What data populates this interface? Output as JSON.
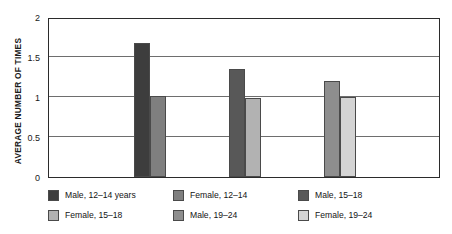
{
  "chart_data": {
    "type": "bar",
    "title": "",
    "xlabel": "",
    "ylabel": "AVERAGE NUMBER OF TIMES",
    "ylim": [
      0,
      2
    ],
    "yticks": [
      0,
      0.5,
      1,
      1.5,
      2
    ],
    "ytick_labels": [
      "0",
      "0.5",
      "1",
      "1.5",
      "2"
    ],
    "grid": true,
    "legend_position": "bottom",
    "categories": [
      "12–14 years",
      "15–18",
      "19–24"
    ],
    "series": [
      {
        "name": "Male",
        "values": [
          1.68,
          1.35,
          1.2
        ]
      },
      {
        "name": "Female",
        "values": [
          1.01,
          0.99,
          1.0
        ]
      }
    ],
    "bars": [
      {
        "label": "Male, 12–14 years",
        "value": 1.68,
        "color": "#3d3d3d"
      },
      {
        "label": "Female, 12–14",
        "value": 1.01,
        "color": "#7f7f7f"
      },
      {
        "label": "Male, 15–18",
        "value": 1.35,
        "color": "#585858"
      },
      {
        "label": "Female, 15–18",
        "value": 0.99,
        "color": "#b2b2b2"
      },
      {
        "label": "Male, 19–24",
        "value": 1.2,
        "color": "#8e8e8e"
      },
      {
        "label": "Female, 19–24",
        "value": 1.0,
        "color": "#d4d4d4"
      }
    ]
  },
  "axis": {
    "y_title": "AVERAGE NUMBER OF TIMES",
    "ticks": [
      {
        "label": "2",
        "value": 2
      },
      {
        "label": "1.5",
        "value": 1.5
      },
      {
        "label": "1",
        "value": 1
      },
      {
        "label": "0.5",
        "value": 0.5
      },
      {
        "label": "0",
        "value": 0
      }
    ]
  },
  "legend": {
    "rows": [
      [
        {
          "label": "Male, 12–14 years",
          "color": "#3d3d3d"
        },
        {
          "label": "Female, 12–14",
          "color": "#7f7f7f"
        },
        {
          "label": "Male, 15–18",
          "color": "#585858"
        }
      ],
      [
        {
          "label": "Female, 15–18",
          "color": "#b2b2b2"
        },
        {
          "label": "Male, 19–24",
          "color": "#8e8e8e"
        },
        {
          "label": "Female, 19–24",
          "color": "#d4d4d4"
        }
      ]
    ]
  },
  "colors": {
    "frame": "#2b2b2b",
    "gridline": "#6e6e6e",
    "background": "#ffffff",
    "text": "#141414"
  }
}
